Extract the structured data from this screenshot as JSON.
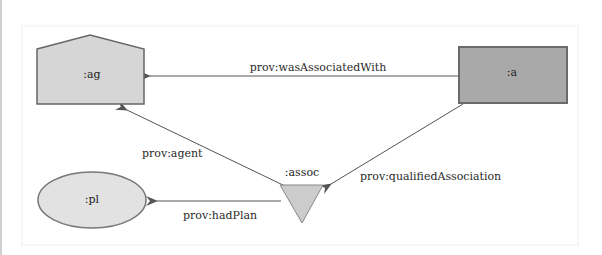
{
  "diagram": {
    "type": "PROV qualified association",
    "colors": {
      "agent_fill": "#d6d6d6",
      "activity_fill": "#a9a9a9",
      "plan_fill": "#e2e2e2",
      "assoc_fill": "#cccccc",
      "stroke": "#666666",
      "edge": "#555555",
      "frame": "#eeeeee"
    },
    "nodes": {
      "agent": {
        "id": ":ag",
        "shape": "pentagon",
        "label": ":ag"
      },
      "activity": {
        "id": ":a",
        "shape": "rectangle",
        "label": ":a"
      },
      "association": {
        "id": ":assoc",
        "shape": "inverted-triangle",
        "label": ":assoc"
      },
      "plan": {
        "id": ":pl",
        "shape": "ellipse",
        "label": ":pl"
      }
    },
    "edges": [
      {
        "from": ":a",
        "to": ":ag",
        "label": "prov:wasAssociatedWith"
      },
      {
        "from": ":a",
        "to": ":assoc",
        "label": "prov:qualifiedAssociation"
      },
      {
        "from": ":assoc",
        "to": ":ag",
        "label": "prov:agent"
      },
      {
        "from": ":assoc",
        "to": ":pl",
        "label": "prov:hadPlan"
      }
    ]
  }
}
